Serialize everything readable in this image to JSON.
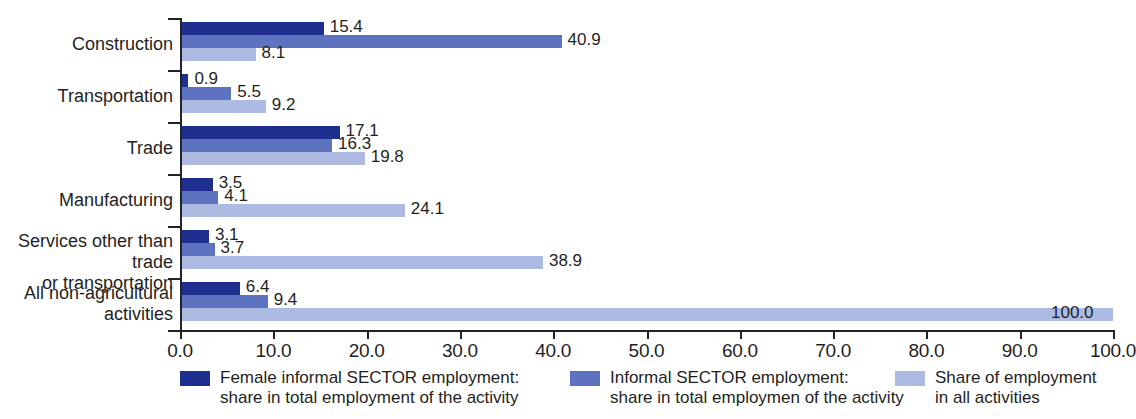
{
  "chart_data": {
    "type": "bar",
    "orientation": "horizontal",
    "title": "",
    "xlabel": "",
    "ylabel": "",
    "xlim": [
      0,
      100
    ],
    "xticks": [
      "0.0",
      "10.0",
      "20.0",
      "30.0",
      "40.0",
      "50.0",
      "60.0",
      "70.0",
      "80.0",
      "90.0",
      "100.0"
    ],
    "grid": false,
    "legend_position": "bottom",
    "categories": [
      "Construction",
      "Transportation",
      "Trade",
      "Manufacturing",
      "Services other than trade\nor transportation",
      "All non-agricultural\nactivities"
    ],
    "series": [
      {
        "name": "Female informal SECTOR employment:\nshare in total employment of the activity",
        "color": "#1f2f8f",
        "values": [
          15.4,
          0.9,
          17.1,
          3.5,
          3.1,
          6.4
        ],
        "labels": [
          "15.4",
          "0.9",
          "17.1",
          "3.5",
          "3.1",
          "6.4"
        ]
      },
      {
        "name": "Informal SECTOR employment:\nshare in total employmen of the activity",
        "color": "#5e73bf",
        "values": [
          40.9,
          5.5,
          16.3,
          4.1,
          3.7,
          9.4
        ],
        "labels": [
          "40.9",
          "5.5",
          "16.3",
          "4.1",
          "3.7",
          "9.4"
        ]
      },
      {
        "name": "Share of employment\nin all activities",
        "color": "#adbbe2",
        "values": [
          8.1,
          9.2,
          19.8,
          24.1,
          38.9,
          100.0
        ],
        "labels": [
          "8.1",
          "9.2",
          "19.8",
          "24.1",
          "38.9",
          "100.0"
        ]
      }
    ]
  },
  "legend": {
    "items": [
      {
        "label": "Female informal SECTOR employment:\nshare in total employment of the activity",
        "color": "#1f2f8f"
      },
      {
        "label": "Informal SECTOR employment:\nshare in total employmen of the activity",
        "color": "#5e73bf"
      },
      {
        "label": "Share of employment\nin all activities",
        "color": "#adbbe2"
      }
    ]
  }
}
